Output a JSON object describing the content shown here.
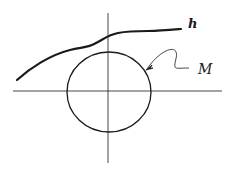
{
  "diagram": {
    "labels": {
      "curve": "h",
      "circle": "M"
    },
    "colors": {
      "stroke": "#1a1a1a",
      "background": "#ffffff"
    },
    "elements": [
      {
        "name": "horizontal-axis",
        "type": "line"
      },
      {
        "name": "vertical-axis",
        "type": "line"
      },
      {
        "name": "circle-M",
        "type": "circle"
      },
      {
        "name": "curve-h",
        "type": "curve"
      },
      {
        "name": "leader-arrow-M",
        "type": "arrow"
      }
    ]
  }
}
